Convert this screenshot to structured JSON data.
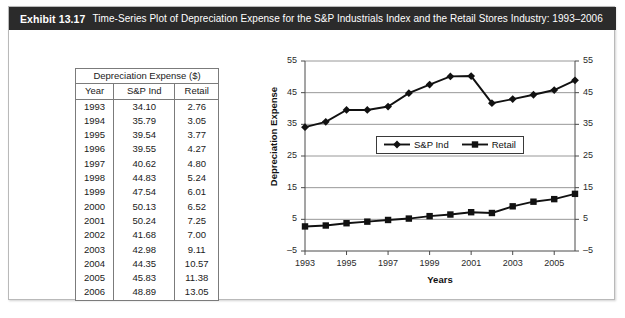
{
  "header": {
    "exhibit_label": "Exhibit 13.17",
    "title": "Time-Series Plot of Depreciation Expense for the S&P Industrials Index and the Retail Stores Industry: 1993–2006"
  },
  "table": {
    "caption": "Depreciation Expense ($)",
    "columns": [
      "Year",
      "S&P Ind",
      "Retail"
    ],
    "rows": [
      [
        "1993",
        "34.10",
        "2.76"
      ],
      [
        "1994",
        "35.79",
        "3.05"
      ],
      [
        "1995",
        "39.54",
        "3.77"
      ],
      [
        "1996",
        "39.55",
        "4.27"
      ],
      [
        "1997",
        "40.62",
        "4.80"
      ],
      [
        "1998",
        "44.83",
        "5.24"
      ],
      [
        "1999",
        "47.54",
        "6.01"
      ],
      [
        "2000",
        "50.13",
        "6.52"
      ],
      [
        "2001",
        "50.24",
        "7.25"
      ],
      [
        "2002",
        "41.68",
        "7.00"
      ],
      [
        "2003",
        "42.98",
        "9.11"
      ],
      [
        "2004",
        "44.35",
        "10.57"
      ],
      [
        "2005",
        "45.83",
        "11.38"
      ],
      [
        "2006",
        "48.89",
        "13.05"
      ]
    ]
  },
  "chart_data": {
    "type": "line",
    "title": "",
    "xlabel": "Years",
    "ylabel": "Depreciation Expense",
    "x": [
      1993,
      1994,
      1995,
      1996,
      1997,
      1998,
      1999,
      2000,
      2001,
      2002,
      2003,
      2004,
      2005,
      2006
    ],
    "xlim": [
      1993,
      2006
    ],
    "ylim": [
      -5,
      55
    ],
    "yticks": [
      -5,
      5,
      15,
      25,
      35,
      45,
      55
    ],
    "ytick_labels": [
      "–5",
      "5",
      "15",
      "25",
      "35",
      "45",
      "55"
    ],
    "xticks": [
      1993,
      1995,
      1997,
      1999,
      2001,
      2003,
      2005
    ],
    "xtick_labels": [
      "1993",
      "1995",
      "1997",
      "1999",
      "2001",
      "2003",
      "2005"
    ],
    "right_axis_labels": [
      "–5",
      "5",
      "15",
      "25",
      "35",
      "45",
      "55"
    ],
    "grid": "horizontal",
    "legend_position": "center",
    "series": [
      {
        "name": "S&P Ind",
        "marker": "diamond",
        "color": "#111111",
        "values": [
          34.1,
          35.79,
          39.54,
          39.55,
          40.62,
          44.83,
          47.54,
          50.13,
          50.24,
          41.68,
          42.98,
          44.35,
          45.83,
          48.89
        ]
      },
      {
        "name": "Retail",
        "marker": "square",
        "color": "#111111",
        "values": [
          2.76,
          3.05,
          3.77,
          4.27,
          4.8,
          5.24,
          6.01,
          6.52,
          7.25,
          7.0,
          9.11,
          10.57,
          11.38,
          13.05
        ]
      }
    ]
  },
  "colors": {
    "header_bar": "#2b2b2b",
    "header_text": "#ffffff",
    "card_border": "#b9b9b9",
    "table_border": "#7b7b7b",
    "series": "#111111",
    "gridline": "#8c8c8c"
  }
}
